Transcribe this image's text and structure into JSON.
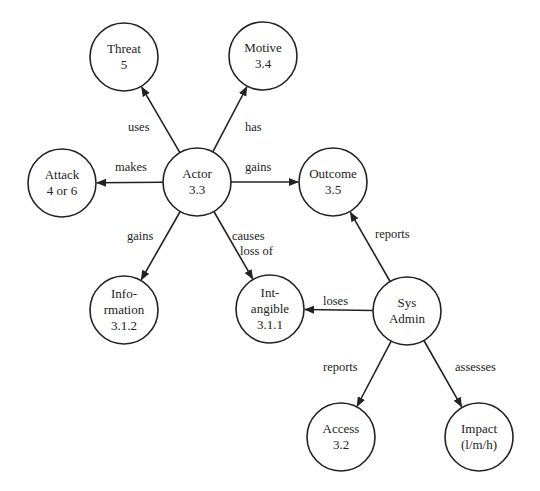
{
  "diagram": {
    "nodes": [
      {
        "id": "threat",
        "lines": [
          "Threat",
          "5"
        ],
        "cx": 124,
        "cy": 57
      },
      {
        "id": "motive",
        "lines": [
          "Motive",
          "3.4"
        ],
        "cx": 263,
        "cy": 56
      },
      {
        "id": "attack",
        "lines": [
          "Attack",
          "4 or 6"
        ],
        "cx": 62,
        "cy": 183
      },
      {
        "id": "actor",
        "lines": [
          "Actor",
          "3.3"
        ],
        "cx": 197,
        "cy": 182
      },
      {
        "id": "outcome",
        "lines": [
          "Outcome",
          "3.5"
        ],
        "cx": 333,
        "cy": 182
      },
      {
        "id": "information",
        "lines": [
          "Info-",
          "rmation",
          "3.1.2"
        ],
        "cx": 124,
        "cy": 310
      },
      {
        "id": "intangible",
        "lines": [
          "Int-",
          "angible",
          "3.1.1"
        ],
        "cx": 270,
        "cy": 309
      },
      {
        "id": "sysadmin",
        "lines": [
          "Sys",
          "Admin"
        ],
        "cx": 407,
        "cy": 311
      },
      {
        "id": "access",
        "lines": [
          "Access",
          "3.2"
        ],
        "cx": 341,
        "cy": 437
      },
      {
        "id": "impact",
        "lines": [
          "Impact",
          "(l/m/h)"
        ],
        "cx": 479,
        "cy": 437
      }
    ],
    "edges": [
      {
        "from": "actor",
        "to": "threat",
        "label": [
          "uses"
        ],
        "lx": 128,
        "ly": 131,
        "anchor": "start"
      },
      {
        "from": "actor",
        "to": "motive",
        "label": [
          "has"
        ],
        "lx": 245,
        "ly": 131,
        "anchor": "start"
      },
      {
        "from": "actor",
        "to": "attack",
        "label": [
          "makes"
        ],
        "lx": 115,
        "ly": 171,
        "anchor": "start"
      },
      {
        "from": "actor",
        "to": "outcome",
        "label": [
          "gains"
        ],
        "lx": 245,
        "ly": 171,
        "anchor": "start"
      },
      {
        "from": "actor",
        "to": "information",
        "label": [
          "gains"
        ],
        "lx": 127,
        "ly": 240,
        "anchor": "start"
      },
      {
        "from": "actor",
        "to": "intangible",
        "label": [
          "causes",
          "loss of"
        ],
        "lx": 232,
        "ly": 240,
        "anchor": "start"
      },
      {
        "from": "sysadmin",
        "to": "outcome",
        "label": [
          "reports"
        ],
        "lx": 375,
        "ly": 238,
        "anchor": "start"
      },
      {
        "from": "sysadmin",
        "to": "intangible",
        "label": [
          "loses"
        ],
        "lx": 323,
        "ly": 305,
        "anchor": "start"
      },
      {
        "from": "sysadmin",
        "to": "access",
        "label": [
          "reports"
        ],
        "lx": 323,
        "ly": 371,
        "anchor": "start"
      },
      {
        "from": "sysadmin",
        "to": "impact",
        "label": [
          "assesses"
        ],
        "lx": 455,
        "ly": 371,
        "anchor": "start"
      }
    ],
    "radius": 34,
    "stroke_color": "#222222",
    "background_color": "#ffffff"
  }
}
